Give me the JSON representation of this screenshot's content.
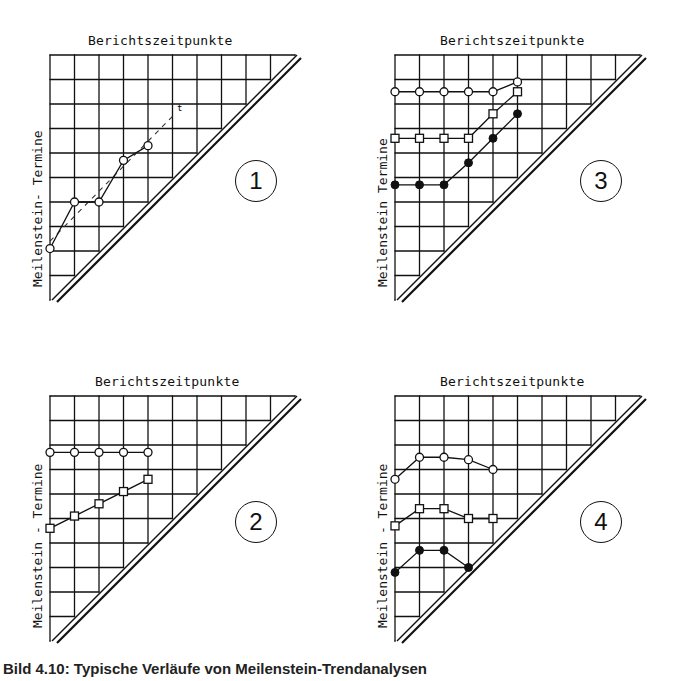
{
  "panels": [
    {
      "id": 1,
      "number": "1",
      "title": "Berichtszeitpunkte",
      "ylabel": "Meilenstein- Termine",
      "origin": [
        50,
        55
      ],
      "title_pos": [
        110,
        12
      ],
      "ylabel_pos": [
        32,
        282
      ],
      "num_pos": [
        232,
        207
      ],
      "trend_label": "t",
      "series": [
        {
          "name": "milestone-1",
          "marker": "circle-open",
          "points": [
            [
              0,
              7.9
            ],
            [
              1,
              6.0
            ],
            [
              2,
              6.0
            ],
            [
              3,
              4.3
            ],
            [
              4,
              3.7
            ]
          ]
        }
      ],
      "trend": {
        "from": [
          0,
          7.6
        ],
        "to": [
          5.1,
          2.4
        ]
      }
    },
    {
      "id": 3,
      "number": "3",
      "title": "Berichtszeitpunkte",
      "ylabel": "Meilenstein Termine",
      "origin": [
        395,
        55
      ],
      "title_pos": [
        92,
        -50
      ],
      "ylabel_pos": [
        -14,
        228
      ],
      "num_pos": [
        220,
        165
      ],
      "series": [
        {
          "name": "milestone-a",
          "marker": "circle-open",
          "points": [
            [
              0,
              1.5
            ],
            [
              1,
              1.5
            ],
            [
              2,
              1.5
            ],
            [
              3,
              1.5
            ],
            [
              4,
              1.5
            ],
            [
              5,
              1.1
            ]
          ]
        },
        {
          "name": "milestone-b",
          "marker": "square-open",
          "points": [
            [
              0,
              3.4
            ],
            [
              1,
              3.4
            ],
            [
              2,
              3.4
            ],
            [
              3,
              3.4
            ],
            [
              4,
              2.4
            ],
            [
              5,
              1.5
            ]
          ]
        },
        {
          "name": "milestone-c",
          "marker": "dot-filled",
          "points": [
            [
              0,
              5.3
            ],
            [
              1,
              5.3
            ],
            [
              2,
              5.3
            ],
            [
              3,
              4.4
            ],
            [
              4,
              3.4
            ],
            [
              5,
              2.4
            ]
          ]
        }
      ]
    },
    {
      "id": 2,
      "number": "2",
      "title": "Berichtszeitpunkte",
      "ylabel": "Meilenstein - Termine",
      "origin": [
        50,
        396
      ],
      "title_pos": [
        40,
        -47
      ],
      "ylabel_pos": [
        -20,
        230
      ],
      "num_pos": [
        206,
        165
      ],
      "series": [
        {
          "name": "milestone-a",
          "marker": "circle-open",
          "points": [
            [
              0,
              2.3
            ],
            [
              1,
              2.3
            ],
            [
              2,
              2.3
            ],
            [
              3,
              2.3
            ],
            [
              4,
              2.3
            ]
          ]
        },
        {
          "name": "milestone-b",
          "marker": "square-open",
          "points": [
            [
              0,
              5.4
            ],
            [
              1,
              4.9
            ],
            [
              2,
              4.4
            ],
            [
              3,
              3.9
            ],
            [
              4,
              3.4
            ]
          ]
        }
      ]
    },
    {
      "id": 4,
      "number": "4",
      "title": "Berichtszeitpunkte",
      "ylabel": "Meilenstein - Termine",
      "origin": [
        395,
        396
      ],
      "title_pos": [
        40,
        -47
      ],
      "ylabel_pos": [
        -20,
        230
      ],
      "num_pos": [
        222,
        165
      ],
      "series": [
        {
          "name": "milestone-a",
          "marker": "circle-open",
          "points": [
            [
              0,
              3.4
            ],
            [
              1,
              2.5
            ],
            [
              2,
              2.5
            ],
            [
              3,
              2.6
            ],
            [
              4,
              3.0
            ]
          ]
        },
        {
          "name": "milestone-b",
          "marker": "square-open",
          "points": [
            [
              0,
              5.3
            ],
            [
              1,
              4.6
            ],
            [
              2,
              4.6
            ],
            [
              3,
              5.0
            ],
            [
              4,
              5.0
            ]
          ]
        },
        {
          "name": "milestone-c",
          "marker": "dot-filled",
          "points": [
            [
              0,
              7.2
            ],
            [
              1,
              6.3
            ],
            [
              2,
              6.3
            ],
            [
              3,
              7.0
            ]
          ]
        }
      ]
    }
  ],
  "grid": {
    "cols": 10,
    "rows": 10,
    "cell": 24.5
  },
  "caption": "Bild 4.10: Typische Verläufe von Meilenstein-Trendanalysen",
  "legend": {
    "x_axis": "Berichtszeitpunkte",
    "y_axis": "Meilenstein-Termine"
  },
  "chart_data": [
    {
      "type": "line",
      "title": "1",
      "xlabel": "Berichtszeitpunkte",
      "ylabel": "Meilenstein- Termine",
      "grid": true,
      "series": [
        {
          "name": "Meilenstein",
          "x": [
            0,
            1,
            2,
            3,
            4
          ],
          "y_rows_from_top": [
            7.9,
            6.0,
            6.0,
            4.3,
            4.7
          ]
        }
      ],
      "annotations": [
        "dashed trend line labelled t"
      ]
    },
    {
      "type": "line",
      "title": "2",
      "xlabel": "Berichtszeitpunkte",
      "ylabel": "Meilenstein - Termine",
      "grid": true,
      "series": [
        {
          "name": "circle",
          "x": [
            0,
            1,
            2,
            3,
            4
          ],
          "y_rows_from_top": [
            2.3,
            2.3,
            2.3,
            2.3,
            2.3
          ]
        },
        {
          "name": "square",
          "x": [
            0,
            1,
            2,
            3,
            4
          ],
          "y_rows_from_top": [
            5.4,
            4.9,
            4.4,
            3.9,
            3.4
          ]
        }
      ]
    },
    {
      "type": "line",
      "title": "3",
      "xlabel": "Berichtszeitpunkte",
      "ylabel": "Meilenstein Termine",
      "grid": true,
      "series": [
        {
          "name": "circle",
          "x": [
            0,
            1,
            2,
            3,
            4,
            5
          ],
          "y_rows_from_top": [
            1.5,
            1.5,
            1.5,
            1.5,
            1.5,
            1.1
          ]
        },
        {
          "name": "square",
          "x": [
            0,
            1,
            2,
            3,
            4,
            5
          ],
          "y_rows_from_top": [
            3.4,
            3.4,
            3.4,
            3.4,
            2.4,
            1.5
          ]
        },
        {
          "name": "filled",
          "x": [
            0,
            1,
            2,
            3,
            4,
            5
          ],
          "y_rows_from_top": [
            5.3,
            5.3,
            5.3,
            4.4,
            3.4,
            2.4
          ]
        }
      ]
    },
    {
      "type": "line",
      "title": "4",
      "xlabel": "Berichtszeitpunkte",
      "ylabel": "Meilenstein - Termine",
      "grid": true,
      "series": [
        {
          "name": "circle",
          "x": [
            0,
            1,
            2,
            3,
            4
          ],
          "y_rows_from_top": [
            3.4,
            2.5,
            2.5,
            2.6,
            3.0
          ]
        },
        {
          "name": "square",
          "x": [
            0,
            1,
            2,
            3,
            4
          ],
          "y_rows_from_top": [
            5.3,
            4.6,
            4.6,
            5.0,
            5.0
          ]
        },
        {
          "name": "filled",
          "x": [
            0,
            1,
            2,
            3
          ],
          "y_rows_from_top": [
            7.2,
            6.3,
            6.3,
            7.0
          ]
        }
      ]
    }
  ]
}
